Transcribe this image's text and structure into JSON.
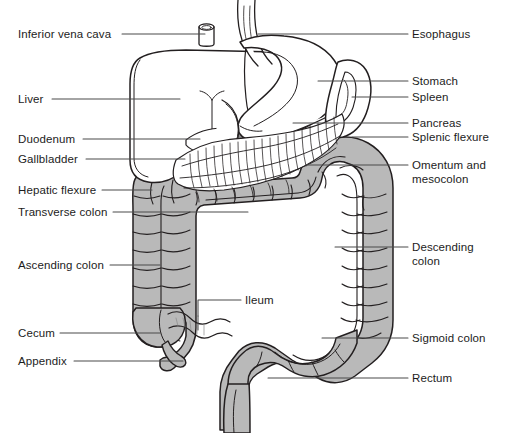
{
  "figure": {
    "width": 505,
    "height": 433,
    "background_color": "#ffffff",
    "line_color": "#231f20",
    "leader_line_color": "#4a4a4a",
    "colon_fill_color": "#b9b9b9",
    "colon_shadow_color": "#8e8e8e",
    "organ_fill_color": "#ffffff",
    "text_color": "#1c1c1c"
  },
  "labels": {
    "left": [
      {
        "id": "inferior-vena-cava",
        "text": "Inferior vena cava",
        "x": 18,
        "y": 28,
        "leader_x1": 122,
        "leader_y1": 34,
        "leader_x2": 205,
        "leader_y2": 34
      },
      {
        "id": "liver",
        "text": "Liver",
        "x": 18,
        "y": 93,
        "leader_x1": 52,
        "leader_y1": 99,
        "leader_x2": 180,
        "leader_y2": 99
      },
      {
        "id": "duodenum",
        "text": "Duodenum",
        "x": 18,
        "y": 133,
        "leader_x1": 83,
        "leader_y1": 139,
        "leader_x2": 200,
        "leader_y2": 139
      },
      {
        "id": "gallbladder",
        "text": "Gallbladder",
        "x": 18,
        "y": 153,
        "leader_x1": 86,
        "leader_y1": 159,
        "leader_x2": 185,
        "leader_y2": 159
      },
      {
        "id": "hepatic-flexure",
        "text": "Hepatic flexure",
        "x": 18,
        "y": 184,
        "leader_x1": 102,
        "leader_y1": 190,
        "leader_x2": 152,
        "leader_y2": 190
      },
      {
        "id": "transverse-colon",
        "text": "Transverse colon",
        "x": 18,
        "y": 206,
        "leader_x1": 113,
        "leader_y1": 212,
        "leader_x2": 248,
        "leader_y2": 212
      },
      {
        "id": "ascending-colon",
        "text": "Ascending colon",
        "x": 18,
        "y": 259,
        "leader_x1": 110,
        "leader_y1": 265,
        "leader_x2": 160,
        "leader_y2": 265
      },
      {
        "id": "cecum",
        "text": "Cecum",
        "x": 18,
        "y": 327,
        "leader_x1": 60,
        "leader_y1": 333,
        "leader_x2": 160,
        "leader_y2": 333
      },
      {
        "id": "appendix",
        "text": "Appendix",
        "x": 18,
        "y": 355,
        "leader_x1": 74,
        "leader_y1": 361,
        "leader_x2": 183,
        "leader_y2": 361
      }
    ],
    "right": [
      {
        "id": "esophagus",
        "text": "Esophagus",
        "x": 412,
        "y": 28,
        "leader_x1": 258,
        "leader_y1": 34,
        "leader_x2": 408,
        "leader_y2": 34
      },
      {
        "id": "stomach",
        "text": "Stomach",
        "x": 412,
        "y": 75,
        "leader_x1": 318,
        "leader_y1": 81,
        "leader_x2": 408,
        "leader_y2": 81
      },
      {
        "id": "spleen",
        "text": "Spleen",
        "x": 412,
        "y": 91,
        "leader_x1": 352,
        "leader_y1": 97,
        "leader_x2": 408,
        "leader_y2": 97
      },
      {
        "id": "pancreas",
        "text": "Pancreas",
        "x": 412,
        "y": 117,
        "leader_x1": 293,
        "leader_y1": 123,
        "leader_x2": 408,
        "leader_y2": 123
      },
      {
        "id": "splenic-flexure",
        "text": "Splenic flexure",
        "x": 412,
        "y": 131,
        "leader_x1": 352,
        "leader_y1": 137,
        "leader_x2": 408,
        "leader_y2": 137
      },
      {
        "id": "omentum-and-mesocolon",
        "text": "Omentum and\nmesocolon",
        "x": 412,
        "y": 159,
        "leader_x1": 306,
        "leader_y1": 165,
        "leader_x2": 408,
        "leader_y2": 165
      },
      {
        "id": "descending-colon",
        "text": "Descending\ncolon",
        "x": 412,
        "y": 241,
        "leader_x1": 335,
        "leader_y1": 247,
        "leader_x2": 408,
        "leader_y2": 247
      },
      {
        "id": "sigmoid-colon",
        "text": "Sigmoid colon",
        "x": 412,
        "y": 332,
        "leader_x1": 322,
        "leader_y1": 338,
        "leader_x2": 408,
        "leader_y2": 338
      },
      {
        "id": "rectum",
        "text": "Rectum",
        "x": 412,
        "y": 372,
        "leader_x1": 268,
        "leader_y1": 378,
        "leader_x2": 408,
        "leader_y2": 378
      }
    ],
    "center": [
      {
        "id": "ileum",
        "text": "Ileum",
        "x": 245,
        "y": 294,
        "leader_x1": 198,
        "leader_y1": 300,
        "leader_x2": 241,
        "leader_y2": 300
      }
    ]
  },
  "structures": [
    {
      "id": "liver",
      "name": "Liver",
      "fill": "#ffffff"
    },
    {
      "id": "stomach",
      "name": "Stomach",
      "fill": "#ffffff"
    },
    {
      "id": "spleen",
      "name": "Spleen",
      "fill": "#ffffff"
    },
    {
      "id": "pancreas",
      "name": "Pancreas",
      "fill": "#ffffff"
    },
    {
      "id": "gallbladder",
      "name": "Gallbladder",
      "fill": "#9b9b9b"
    },
    {
      "id": "duodenum",
      "name": "Duodenum",
      "fill": "#ffffff"
    },
    {
      "id": "esophagus",
      "name": "Esophagus",
      "fill": "#ffffff"
    },
    {
      "id": "inferior-vena-cava",
      "name": "Inferior vena cava",
      "fill": "#ffffff"
    },
    {
      "id": "omentum",
      "name": "Omentum and mesocolon",
      "fill": "#ffffff"
    },
    {
      "id": "transverse-colon",
      "name": "Transverse colon",
      "fill": "#b9b9b9"
    },
    {
      "id": "ascending-colon",
      "name": "Ascending colon",
      "fill": "#b9b9b9"
    },
    {
      "id": "descending-colon",
      "name": "Descending colon",
      "fill": "#b9b9b9"
    },
    {
      "id": "sigmoid-colon",
      "name": "Sigmoid colon",
      "fill": "#b9b9b9"
    },
    {
      "id": "rectum",
      "name": "Rectum",
      "fill": "#b9b9b9"
    },
    {
      "id": "cecum",
      "name": "Cecum",
      "fill": "#b9b9b9"
    },
    {
      "id": "appendix",
      "name": "Appendix",
      "fill": "#b9b9b9"
    },
    {
      "id": "ileum",
      "name": "Ileum",
      "fill": "#ffffff"
    },
    {
      "id": "hepatic-flexure",
      "name": "Hepatic flexure",
      "fill": "#b9b9b9"
    },
    {
      "id": "splenic-flexure",
      "name": "Splenic flexure",
      "fill": "#b9b9b9"
    }
  ]
}
